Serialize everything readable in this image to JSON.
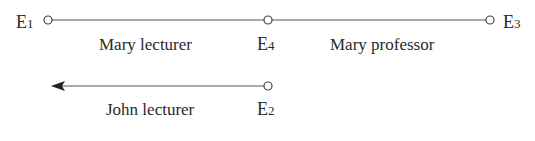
{
  "diagram": {
    "nodes": [
      {
        "id": "E1",
        "letter": "E",
        "sub": "1",
        "x": 48,
        "y": 20
      },
      {
        "id": "E4",
        "letter": "E",
        "sub": "4",
        "x": 268,
        "y": 20
      },
      {
        "id": "E3",
        "letter": "E",
        "sub": "3",
        "x": 490,
        "y": 20
      },
      {
        "id": "E2",
        "letter": "E",
        "sub": "2",
        "x": 268,
        "y": 86
      }
    ],
    "edges": [
      {
        "from": "E1",
        "to": "E4",
        "label": "Mary lecturer"
      },
      {
        "from": "E4",
        "to": "E3",
        "label": "Mary professor"
      },
      {
        "from": "E2",
        "to": "open-left",
        "label": "John lecturer",
        "arrow": "left"
      }
    ],
    "colors": {
      "line": "#555555",
      "text": "#2a2a2a",
      "background": "#ffffff"
    }
  }
}
